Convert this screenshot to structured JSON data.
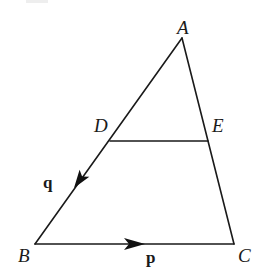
{
  "diagram": {
    "points": {
      "A": {
        "label": "A",
        "x": 182,
        "y": 38,
        "label_x": 177,
        "label_y": 34
      },
      "B": {
        "label": "B",
        "x": 35,
        "y": 244,
        "label_x": 18,
        "label_y": 262
      },
      "C": {
        "label": "C",
        "x": 234,
        "y": 244,
        "label_x": 238,
        "label_y": 262
      },
      "D": {
        "label": "D",
        "x": 110,
        "y": 141,
        "label_x": 94,
        "label_y": 132
      },
      "E": {
        "label": "E",
        "x": 208,
        "y": 141,
        "label_x": 212,
        "label_y": 132
      }
    },
    "segments": [
      {
        "from": "A",
        "to": "B"
      },
      {
        "from": "A",
        "to": "C"
      },
      {
        "from": "B",
        "to": "C"
      },
      {
        "from": "D",
        "to": "E"
      }
    ],
    "vectors": {
      "q": {
        "label": "q",
        "along": "B→D",
        "label_x": 43,
        "label_y": 188
      },
      "p": {
        "label": "p",
        "along": "B→C",
        "label_x": 146,
        "label_y": 263
      }
    },
    "colors": {
      "stroke": "#1a1a1a",
      "background": "#ffffff"
    }
  }
}
